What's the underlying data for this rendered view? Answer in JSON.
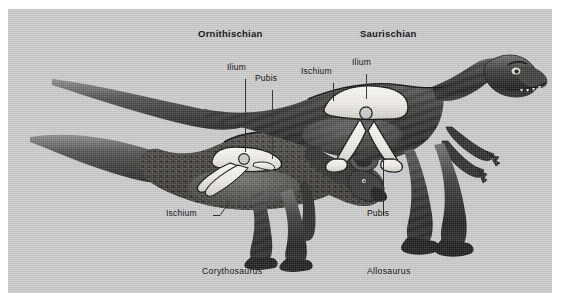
{
  "figure": {
    "background_color": "#ffffff",
    "plate_color": "#c9c9c9",
    "ink_color": "#17181a",
    "bone_color": "#f2f0ec"
  },
  "headers": [
    {
      "label": "Ornithischian",
      "x": 238,
      "y": 26
    },
    {
      "label": "Saurischian",
      "x": 393,
      "y": 26
    }
  ],
  "callouts": [
    {
      "label": "Ilium",
      "x": 237,
      "y": 62,
      "group": "ornithischian"
    },
    {
      "label": "Pubis",
      "x": 264,
      "y": 73,
      "group": "ornithischian"
    },
    {
      "label": "Ischium",
      "x": 186,
      "y": 210,
      "group": "ornithischian"
    },
    {
      "label": "Ischium",
      "x": 323,
      "y": 66,
      "group": "saurischian"
    },
    {
      "label": "Ilium",
      "x": 361,
      "y": 57,
      "group": "saurischian"
    },
    {
      "label": "Pubis",
      "x": 387,
      "y": 211,
      "group": "saurischian"
    }
  ],
  "captions": [
    {
      "label": "Corythosaurus",
      "x": 243,
      "y": 271,
      "group": "ornithischian"
    },
    {
      "label": "Allosaurus",
      "x": 392,
      "y": 271,
      "group": "saurischian"
    }
  ],
  "bones": {
    "ornithischian": [
      "ilium",
      "pubis",
      "ischium"
    ],
    "saurischian": [
      "ilium",
      "pubis",
      "ischium"
    ]
  }
}
